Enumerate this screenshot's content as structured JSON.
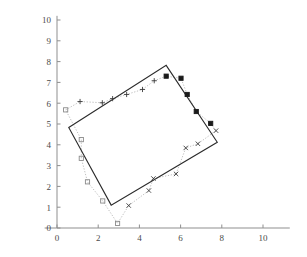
{
  "figure": {
    "title": "",
    "background_color": "#ffffff",
    "axis_color": "#8f8f8f",
    "outline_color": "#2b2b2b",
    "measure_color": "#b0b0b0"
  },
  "chart_data": {
    "type": "scatter",
    "title": "",
    "xlabel": "",
    "ylabel": "",
    "xlim": [
      -0.6,
      11.3
    ],
    "ylim": [
      0,
      10.2
    ],
    "xticks": [
      0,
      2,
      4,
      6,
      8,
      10
    ],
    "xtick_labels": [
      "0",
      "2",
      "4",
      "6",
      "8",
      "10"
    ],
    "yticks": [
      0,
      1,
      2,
      3,
      4,
      5,
      6,
      7,
      8,
      9,
      10
    ],
    "ytick_labels": [
      "0",
      "1",
      "2",
      "3",
      "4",
      "5",
      "6",
      "7",
      "8",
      "9",
      "10"
    ],
    "grid": false,
    "legend": null,
    "annotations": [],
    "series": [
      {
        "name": "rectangle-outline",
        "type": "line",
        "style": "solid",
        "color": "#2b2b2b",
        "closed": true,
        "points": [
          [
            0.57,
            4.83
          ],
          [
            5.3,
            7.82
          ],
          [
            7.78,
            4.12
          ],
          [
            2.63,
            1.1
          ]
        ]
      },
      {
        "name": "measurement-polyline",
        "type": "line",
        "style": "dotted",
        "color": "#b0b0b0",
        "closed": true,
        "points": [
          [
            0.42,
            5.68
          ],
          [
            1.12,
            6.08
          ],
          [
            2.2,
            6.02
          ],
          [
            2.7,
            6.22
          ],
          [
            3.38,
            6.42
          ],
          [
            4.15,
            6.66
          ],
          [
            4.72,
            7.08
          ],
          [
            5.3,
            7.3
          ],
          [
            6.02,
            7.2
          ],
          [
            6.32,
            6.42
          ],
          [
            6.76,
            5.6
          ],
          [
            7.46,
            5.03
          ],
          [
            7.72,
            4.68
          ],
          [
            6.84,
            4.05
          ],
          [
            6.25,
            3.85
          ],
          [
            5.78,
            2.6
          ],
          [
            4.68,
            2.38
          ],
          [
            4.46,
            1.8
          ],
          [
            3.48,
            1.08
          ],
          [
            2.94,
            0.22
          ],
          [
            2.22,
            1.3
          ],
          [
            1.48,
            2.22
          ],
          [
            1.18,
            3.35
          ],
          [
            1.18,
            4.25
          ],
          [
            0.42,
            5.68
          ]
        ]
      },
      {
        "name": "left-edge-samples",
        "marker": "square-open",
        "color": "#8a8a8a",
        "points": [
          [
            0.42,
            5.68
          ],
          [
            1.18,
            4.25
          ],
          [
            1.18,
            3.35
          ],
          [
            1.48,
            2.22
          ],
          [
            2.22,
            1.3
          ],
          [
            2.94,
            0.22
          ]
        ]
      },
      {
        "name": "top-edge-samples",
        "marker": "plus",
        "color": "#3a3a3a",
        "points": [
          [
            1.12,
            6.08
          ],
          [
            2.2,
            6.02
          ],
          [
            2.7,
            6.22
          ],
          [
            3.38,
            6.42
          ],
          [
            4.15,
            6.66
          ],
          [
            4.72,
            7.08
          ]
        ]
      },
      {
        "name": "right-edge-samples",
        "marker": "square-filled",
        "color": "#1a1a1a",
        "points": [
          [
            5.3,
            7.3
          ],
          [
            6.02,
            7.2
          ],
          [
            6.32,
            6.42
          ],
          [
            6.76,
            5.6
          ],
          [
            7.46,
            5.03
          ]
        ]
      },
      {
        "name": "bottom-edge-samples",
        "marker": "cross",
        "color": "#3a3a3a",
        "points": [
          [
            7.72,
            4.68
          ],
          [
            6.84,
            4.05
          ],
          [
            6.25,
            3.85
          ],
          [
            5.78,
            2.6
          ],
          [
            4.68,
            2.38
          ],
          [
            4.46,
            1.8
          ],
          [
            3.48,
            1.08
          ]
        ]
      }
    ]
  }
}
